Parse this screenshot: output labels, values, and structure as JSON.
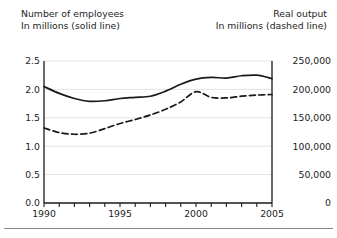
{
  "header": {
    "left_line1": "Number of employees",
    "left_line2": "In millions (solid line)",
    "right_line1": "Real output",
    "right_line2": "In millions (dashed line)"
  },
  "chart_data": {
    "type": "line",
    "title": "",
    "xlabel": "",
    "ylabel": "Number of employees In millions (solid line)",
    "y2label": "Real output In millions (dashed line)",
    "grid": true,
    "legend": "inline-axis-titles",
    "x": [
      1990,
      1991,
      1992,
      1993,
      1994,
      1995,
      1996,
      1997,
      1998,
      1999,
      2000,
      2001,
      2002,
      2003,
      2004,
      2005
    ],
    "xlim": [
      1990,
      2005
    ],
    "xticks": [
      1990,
      1991,
      1992,
      1993,
      1994,
      1995,
      1996,
      1997,
      1998,
      1999,
      2000,
      2001,
      2002,
      2003,
      2004,
      2005
    ],
    "xtick_labels": [
      "1990",
      "",
      "",
      "",
      "",
      "1995",
      "",
      "",
      "",
      "",
      "2000",
      "",
      "",
      "",
      "",
      "2005"
    ],
    "ylim": [
      0.0,
      2.5
    ],
    "yticks": [
      0.0,
      0.5,
      1.0,
      1.5,
      2.0,
      2.5
    ],
    "ytick_labels": [
      "0.0",
      "0.5",
      "1.0",
      "1.5",
      "2.0",
      "2.5"
    ],
    "y2lim": [
      0,
      250000
    ],
    "y2ticks": [
      0,
      50000,
      100000,
      150000,
      200000,
      250000
    ],
    "y2tick_labels": [
      "0",
      "50,000",
      "100,000",
      "150,000",
      "200,000",
      "250,000"
    ],
    "series": [
      {
        "name": "Number of employees",
        "axis": "left",
        "style": "solid",
        "color": "#1a1a1a",
        "values": [
          2.05,
          1.93,
          1.84,
          1.79,
          1.8,
          1.84,
          1.86,
          1.88,
          1.97,
          2.09,
          2.18,
          2.21,
          2.2,
          2.24,
          2.25,
          2.19
        ]
      },
      {
        "name": "Real output",
        "axis": "right",
        "style": "dashed",
        "color": "#1a1a1a",
        "values": [
          132000,
          124000,
          121000,
          123000,
          131000,
          140000,
          147000,
          155000,
          165000,
          178000,
          196000,
          186000,
          185000,
          188000,
          190000,
          191000
        ]
      }
    ]
  }
}
